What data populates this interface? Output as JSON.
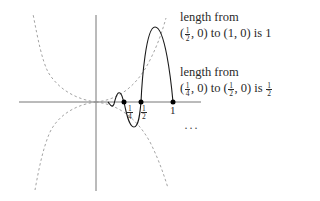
{
  "diagram": {
    "annotations": [
      {
        "line1": "length from",
        "line2_prefix": "(",
        "start_num": "1",
        "start_den": "2",
        "line2_mid1": ", 0) to (1, 0) is 1"
      },
      {
        "line1": "length from",
        "line2_prefix": "(",
        "start_num": "1",
        "start_den": "4",
        "line2_mid1": ", 0) to (",
        "end_num": "1",
        "end_den": "2",
        "line2_mid2": ", 0) is ",
        "len_num": "1",
        "len_den": "2"
      }
    ],
    "ticks": {
      "quarter": {
        "num": "1",
        "den": "4"
      },
      "half": {
        "num": "1",
        "den": "2"
      },
      "one": "1"
    },
    "ellipsis": "···",
    "colors": {
      "curve": "#1a1a1a",
      "axis": "#555555",
      "envelope": "#999999",
      "point": "#000000"
    }
  }
}
